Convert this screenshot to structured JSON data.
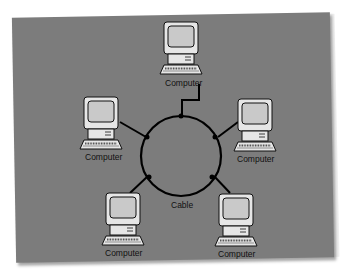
{
  "diagram": {
    "type": "ring-network-topology",
    "background_color": "#7c7c7c",
    "ring": {
      "label": "Cable",
      "center": [
        182,
        155
      ],
      "radius": 40
    },
    "nodes": [
      {
        "id": "top",
        "label": "Computer",
        "position": "top"
      },
      {
        "id": "left",
        "label": "Computer",
        "position": "upper-left"
      },
      {
        "id": "right",
        "label": "Computer",
        "position": "upper-right"
      },
      {
        "id": "bottom-left",
        "label": "Computer",
        "position": "lower-left"
      },
      {
        "id": "bottom-right",
        "label": "Computer",
        "position": "lower-right"
      }
    ],
    "connections": [
      {
        "from": "top",
        "to": "ring"
      },
      {
        "from": "left",
        "to": "ring"
      },
      {
        "from": "right",
        "to": "ring"
      },
      {
        "from": "bottom-left",
        "to": "ring"
      },
      {
        "from": "bottom-right",
        "to": "ring"
      }
    ]
  }
}
